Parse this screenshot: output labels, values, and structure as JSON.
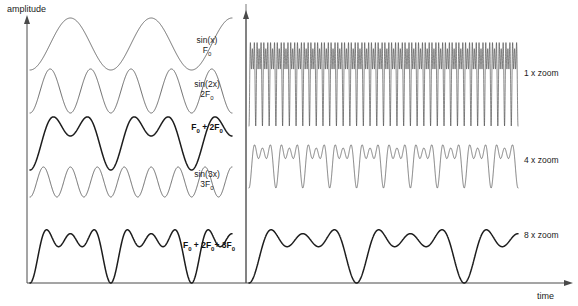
{
  "figure": {
    "axes": {
      "y_label": "amplitude",
      "x_label": "time"
    },
    "colors": {
      "thin_stroke": "#555555",
      "thick_stroke": "#1d1d1d",
      "axis": "#4a4a4a",
      "background": "#ffffff"
    }
  },
  "left_panel": {
    "name": "harmonic-decomposition-panel",
    "waves": [
      {
        "id": "wave-sin-x",
        "label_line1": "sin(x)",
        "label_base": "F",
        "label_sub": "0",
        "weight": "thin",
        "harmonic": 1,
        "amplitude": 1,
        "cycles": 2.5
      },
      {
        "id": "wave-sin-2x",
        "label_line1": "sin(2x)",
        "label_base": "2F",
        "label_sub": "0",
        "weight": "thin",
        "harmonic": 2,
        "amplitude": 1,
        "cycles": 5
      },
      {
        "id": "wave-sum-f0-2f0",
        "label_line1": "",
        "label_base": "F",
        "label_sub": "0",
        "label_tail": " + 2F",
        "label_tail_sub": "0",
        "weight": "thick",
        "harmonic": "1+2",
        "amplitude": 2,
        "cycles": "2.5 + 5"
      },
      {
        "id": "wave-sin-3x",
        "label_line1": "sin(3x)",
        "label_base": "3F",
        "label_sub": "0",
        "weight": "thin",
        "harmonic": 3,
        "amplitude": 1,
        "cycles": 7.5
      },
      {
        "id": "wave-sum-f0-2f0-3f0",
        "label_line1": "",
        "label_base": "F",
        "label_sub": "0",
        "label_mid": " + 2F",
        "label_mid_sub": "0",
        "label_tail": "+ 3F",
        "label_tail_sub": "0",
        "weight": "thick",
        "harmonic": "1+2+3",
        "amplitude": 3,
        "cycles": "2.5 + 5 + 7.5"
      }
    ]
  },
  "right_panel": {
    "name": "zoom-comparison-panel",
    "traces": [
      {
        "id": "trace-zoom-1x",
        "label": "1 x zoom",
        "zoom_factor": 1,
        "cycles": 40,
        "weight": "dense"
      },
      {
        "id": "trace-zoom-4x",
        "label": "4 x zoom",
        "zoom_factor": 4,
        "cycles": 10,
        "weight": "medium"
      },
      {
        "id": "trace-zoom-8x",
        "label": "8 x zoom",
        "zoom_factor": 8,
        "cycles": 2.5,
        "weight": "thick"
      }
    ]
  },
  "chart_data": {
    "type": "line",
    "title": "",
    "xlabel": "time",
    "ylabel": "amplitude",
    "series": [
      {
        "name": "sin(x) / F0",
        "harmonic": 1,
        "amplitude": 1,
        "cycles_displayed": 2.5,
        "panel": "left"
      },
      {
        "name": "sin(2x) / 2F0",
        "harmonic": 2,
        "amplitude": 1,
        "cycles_displayed": 5,
        "panel": "left"
      },
      {
        "name": "F0 + 2F0",
        "harmonic": "1,2",
        "amplitude": 2,
        "cycles_displayed": 2.5,
        "panel": "left"
      },
      {
        "name": "sin(3x) / 3F0",
        "harmonic": 3,
        "amplitude": 1,
        "cycles_displayed": 7.5,
        "panel": "left"
      },
      {
        "name": "F0 + 2F0 + 3F0",
        "harmonic": "1,2,3",
        "amplitude": 3,
        "cycles_displayed": 2.5,
        "panel": "left"
      },
      {
        "name": "1 x zoom",
        "harmonic": "1,2,3",
        "cycles_displayed": 40,
        "panel": "right"
      },
      {
        "name": "4 x zoom",
        "harmonic": "1,2,3",
        "cycles_displayed": 10,
        "panel": "right"
      },
      {
        "name": "8 x zoom",
        "harmonic": "1,2,3",
        "cycles_displayed": 2.5,
        "panel": "right"
      }
    ],
    "grid": false,
    "legend": "inline-right-of-each-trace"
  }
}
